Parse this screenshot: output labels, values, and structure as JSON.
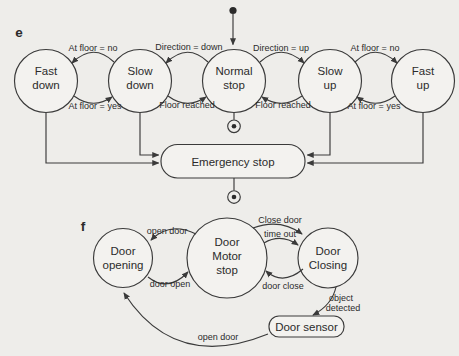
{
  "figure": {
    "colors": {
      "background": "#eeedea",
      "stroke": "#3a3a3a",
      "text": "#2b2b2b",
      "shape_fill": "#f3f2ef"
    },
    "e": {
      "label": "e",
      "states": {
        "fast_down": {
          "line1": "Fast",
          "line2": "down"
        },
        "slow_down": {
          "line1": "Slow",
          "line2": "down"
        },
        "normal_stop": {
          "line1": "Normal",
          "line2": "stop"
        },
        "slow_up": {
          "line1": "Slow",
          "line2": "up"
        },
        "fast_up": {
          "line1": "Fast",
          "line2": "up"
        },
        "emergency_stop": "Emergency stop"
      },
      "transitions": {
        "at_floor_no_left": "At floor = no",
        "at_floor_yes_left": "At floor = yes",
        "direction_down": "Direction = down",
        "floor_reached_left": "Floor reached",
        "direction_up": "Direction = up",
        "floor_reached_right": "Floor reached",
        "at_floor_no_right": "At floor = no",
        "at_floor_yes_right": "At floor = yes"
      }
    },
    "f": {
      "label": "f",
      "states": {
        "door_opening": {
          "line1": "Door",
          "line2": "opening"
        },
        "door_motor_stop": {
          "line1": "Door",
          "line2": "Motor",
          "line3": "stop"
        },
        "door_closing": {
          "line1": "Door",
          "line2": "Closing"
        },
        "door_sensor": "Door sensor"
      },
      "transitions": {
        "open_door_top": "open door",
        "door_open": "door open",
        "close_door": "Close door",
        "time_out": "time out",
        "door_close": "door close",
        "object_detected_line1": "object",
        "object_detected_line2": "detected",
        "open_door_bottom": "open door"
      }
    }
  }
}
